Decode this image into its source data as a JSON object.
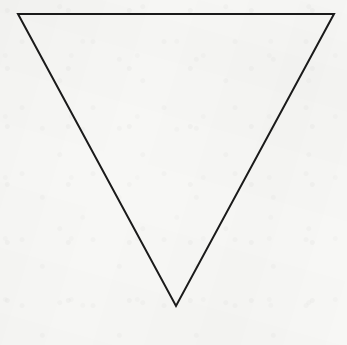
{
  "canvas": {
    "width": 347,
    "height": 345,
    "background_color": "#f7f7f5",
    "medium": "paper"
  },
  "figure": {
    "name": "inverted-triangle",
    "shape_label": "inverted triangle",
    "orientation": "point-down",
    "stroke_color": "#1a1a1a",
    "stroke_width": 2,
    "fill": "none",
    "closed": true,
    "vertices": [
      {
        "label": "top-left",
        "x": 18,
        "y": 14
      },
      {
        "label": "top-right",
        "x": 334,
        "y": 14
      },
      {
        "label": "bottom-apex",
        "x": 176,
        "y": 306
      }
    ],
    "points_attr": "18,14 334,14 176,306",
    "edges": [
      {
        "label": "top-edge",
        "from": "top-left",
        "to": "top-right"
      },
      {
        "label": "right-edge",
        "from": "top-right",
        "to": "bottom-apex"
      },
      {
        "label": "left-edge",
        "from": "bottom-apex",
        "to": "top-left"
      }
    ]
  }
}
